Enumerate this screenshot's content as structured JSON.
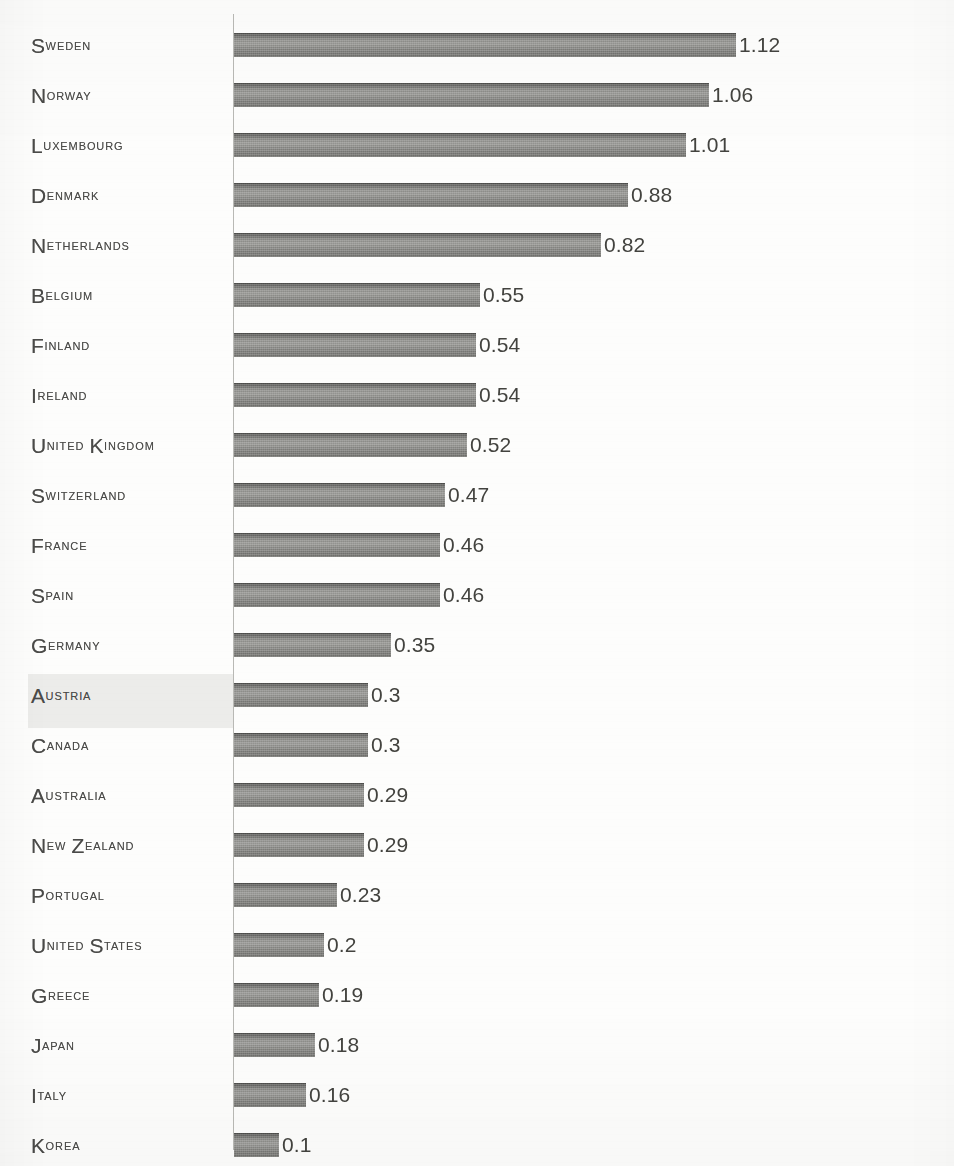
{
  "chart_data": {
    "type": "bar",
    "orientation": "horizontal",
    "title": "",
    "subtitle": "",
    "xlabel": "",
    "ylabel": "",
    "grid": false,
    "legend": null,
    "xlim": [
      0,
      1.12
    ],
    "axis_line": "vertical category axis only",
    "categories": [
      "Sweden",
      "Norway",
      "Luxembourg",
      "Denmark",
      "Netherlands",
      "Belgium",
      "Finland",
      "Ireland",
      "United Kingdom",
      "Switzerland",
      "France",
      "Spain",
      "Germany",
      "Austria",
      "Canada",
      "Australia",
      "New Zealand",
      "Portugal",
      "United States",
      "Greece",
      "Japan",
      "Italy",
      "Korea"
    ],
    "values": [
      1.12,
      1.06,
      1.01,
      0.88,
      0.82,
      0.55,
      0.54,
      0.54,
      0.52,
      0.47,
      0.46,
      0.46,
      0.35,
      0.3,
      0.3,
      0.29,
      0.29,
      0.23,
      0.2,
      0.19,
      0.18,
      0.16,
      0.1
    ],
    "value_labels": [
      "1.12",
      "1.06",
      "1.01",
      "0.88",
      "0.82",
      "0.55",
      "0.54",
      "0.54",
      "0.52",
      "0.47",
      "0.46",
      "0.46",
      "0.35",
      "0.3",
      "0.3",
      "0.29",
      "0.29",
      "0.23",
      "0.2",
      "0.19",
      "0.18",
      "0.16",
      "0.1"
    ],
    "highlighted_category": "Austria",
    "colors": {
      "bar_fill": "#8e8e8b",
      "bar_top_edge": "#6a6a68",
      "value_text": "#43433f",
      "category_text": "#4a4a48",
      "axis_line": "#b9b9b5",
      "row_highlight": "#ececea",
      "background": "#fdfdfc"
    }
  },
  "layout": {
    "axis_x": 233,
    "bar_origin_x": 234,
    "px_per_unit": 448,
    "first_bar_top": 33,
    "row_pitch": 50,
    "bar_height": 24,
    "value_label_gap": 3
  }
}
